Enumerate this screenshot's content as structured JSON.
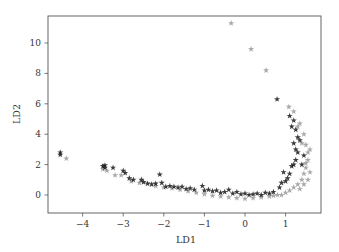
{
  "chart_data": {
    "type": "scatter",
    "title": "",
    "xlabel": "LD1",
    "ylabel": "LD2",
    "xlim": [
      -4.8,
      1.9
    ],
    "ylim": [
      -1.2,
      11.8
    ],
    "xticks": [
      -4,
      -3,
      -2,
      -1,
      0,
      1
    ],
    "yticks": [
      0,
      2,
      4,
      6,
      8,
      10
    ],
    "grid": false,
    "legend": null,
    "marker": "star",
    "colors": {
      "dark": "#1a1a1a",
      "light": "#9a9a9a",
      "frame": "#555555"
    },
    "series": [
      {
        "name": "class-dark",
        "color": "#1a1a1a",
        "points": [
          [
            -4.55,
            2.8
          ],
          [
            -4.55,
            2.65
          ],
          [
            -3.5,
            1.9
          ],
          [
            -3.45,
            1.95
          ],
          [
            -3.45,
            1.8
          ],
          [
            -3.25,
            1.8
          ],
          [
            -3.0,
            1.6
          ],
          [
            -2.95,
            1.45
          ],
          [
            -2.85,
            1.1
          ],
          [
            -2.75,
            1.0
          ],
          [
            -2.55,
            1.0
          ],
          [
            -2.5,
            0.85
          ],
          [
            -2.4,
            0.75
          ],
          [
            -2.3,
            0.7
          ],
          [
            -2.2,
            0.75
          ],
          [
            -2.1,
            1.35
          ],
          [
            -2.05,
            0.8
          ],
          [
            -1.95,
            0.55
          ],
          [
            -1.85,
            0.6
          ],
          [
            -1.75,
            0.55
          ],
          [
            -1.65,
            0.5
          ],
          [
            -1.55,
            0.55
          ],
          [
            -1.45,
            0.4
          ],
          [
            -1.35,
            0.45
          ],
          [
            -1.25,
            0.35
          ],
          [
            -1.05,
            0.6
          ],
          [
            -1.0,
            0.3
          ],
          [
            -0.9,
            0.35
          ],
          [
            -0.8,
            0.25
          ],
          [
            -0.7,
            0.3
          ],
          [
            -0.6,
            0.15
          ],
          [
            -0.5,
            0.2
          ],
          [
            -0.4,
            0.35
          ],
          [
            -0.3,
            0.1
          ],
          [
            -0.2,
            0.2
          ],
          [
            -0.1,
            0.05
          ],
          [
            0.0,
            0.1
          ],
          [
            0.1,
            0.0
          ],
          [
            0.2,
            0.05
          ],
          [
            0.3,
            0.1
          ],
          [
            0.4,
            0.0
          ],
          [
            0.5,
            0.15
          ],
          [
            0.6,
            0.1
          ],
          [
            0.7,
            0.2
          ],
          [
            0.85,
            0.5
          ],
          [
            0.9,
            0.8
          ],
          [
            0.95,
            1.5
          ],
          [
            1.0,
            0.9
          ],
          [
            1.05,
            1.1
          ],
          [
            1.1,
            1.4
          ],
          [
            1.15,
            1.9
          ],
          [
            1.2,
            2.0
          ],
          [
            1.25,
            2.3
          ],
          [
            1.3,
            2.8
          ],
          [
            1.25,
            3.0
          ],
          [
            1.35,
            3.6
          ],
          [
            1.3,
            3.8
          ],
          [
            1.2,
            3.4
          ],
          [
            1.25,
            4.3
          ],
          [
            1.15,
            4.5
          ],
          [
            1.2,
            4.9
          ],
          [
            1.1,
            5.2
          ],
          [
            0.79,
            6.3
          ],
          [
            1.4,
            2.0
          ],
          [
            1.45,
            2.6
          ]
        ]
      },
      {
        "name": "class-light",
        "color": "#9a9a9a",
        "points": [
          [
            -0.34,
            11.3
          ],
          [
            0.15,
            9.6
          ],
          [
            0.52,
            8.2
          ],
          [
            1.08,
            5.8
          ],
          [
            1.2,
            5.5
          ],
          [
            1.35,
            4.7
          ],
          [
            1.45,
            4.0
          ],
          [
            1.5,
            3.3
          ],
          [
            1.55,
            2.8
          ],
          [
            1.55,
            2.3
          ],
          [
            1.5,
            1.8
          ],
          [
            1.45,
            1.4
          ],
          [
            1.4,
            1.0
          ],
          [
            1.3,
            0.7
          ],
          [
            1.2,
            0.5
          ],
          [
            1.1,
            0.3
          ],
          [
            1.0,
            0.15
          ],
          [
            0.8,
            0.0
          ],
          [
            0.6,
            -0.1
          ],
          [
            0.4,
            -0.15
          ],
          [
            0.2,
            -0.2
          ],
          [
            0.0,
            -0.25
          ],
          [
            -0.2,
            -0.2
          ],
          [
            -0.4,
            -0.15
          ],
          [
            -0.6,
            -0.1
          ],
          [
            -0.8,
            -0.05
          ],
          [
            -1.0,
            0.05
          ],
          [
            -1.2,
            0.15
          ],
          [
            -1.4,
            0.25
          ],
          [
            -1.6,
            0.35
          ],
          [
            -1.8,
            0.45
          ],
          [
            -2.0,
            0.5
          ],
          [
            -2.2,
            0.6
          ],
          [
            -2.6,
            0.8
          ],
          [
            -2.8,
            0.9
          ],
          [
            -3.05,
            1.3
          ],
          [
            -3.2,
            1.3
          ],
          [
            -3.4,
            1.6
          ],
          [
            -3.5,
            1.7
          ],
          [
            -4.4,
            2.4
          ],
          [
            1.6,
            1.5
          ],
          [
            1.55,
            1.0
          ],
          [
            1.45,
            0.7
          ],
          [
            1.35,
            0.4
          ],
          [
            1.5,
            2.1
          ],
          [
            0.9,
            0.0
          ],
          [
            0.7,
            -0.05
          ],
          [
            1.6,
            3.0
          ],
          [
            1.4,
            3.4
          ],
          [
            1.3,
            4.5
          ]
        ]
      }
    ]
  }
}
